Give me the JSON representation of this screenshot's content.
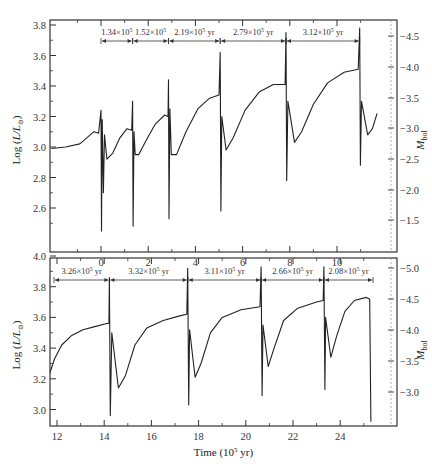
{
  "chart_data": [
    {
      "type": "line",
      "panel": "top",
      "title": "",
      "xlabel": "",
      "ylabel": "Log (L/L⊙)",
      "ylabel_right": "M_bol",
      "xlim": [
        -2.1,
        11.7
      ],
      "ylim": [
        2.45,
        3.85
      ],
      "ylim_right_labels": [
        "-4.5",
        "-4.0",
        "-3.5",
        "-3.0",
        "-2.5",
        "-2.0",
        "-1.5"
      ],
      "x_ticks": [
        "0",
        "2",
        "4",
        "6",
        "8",
        "10"
      ],
      "y_ticks": [
        "3.8",
        "3.6",
        "3.4",
        "3.2",
        "3.0",
        "2.8",
        "2.6"
      ],
      "grid": false,
      "annotations": [
        {
          "text": "1.34×10⁵",
          "x_from": 0.0,
          "x_to": 1.34
        },
        {
          "text": "1.52×10⁵",
          "x_from": 1.34,
          "x_to": 2.86
        },
        {
          "text": "2.19×10⁵ yr",
          "x_from": 2.86,
          "x_to": 5.05
        },
        {
          "text": "2.79×10⁵ yr",
          "x_from": 5.05,
          "x_to": 7.84
        },
        {
          "text": "3.12×10⁵ yr",
          "x_from": 7.84,
          "x_to": 10.96
        }
      ],
      "pulses_x": [
        0.0,
        1.34,
        2.86,
        5.05,
        7.84,
        10.96
      ],
      "series": [
        {
          "name": "luminosity",
          "points": [
            [
              -2.1,
              2.99
            ],
            [
              -1.5,
              3.0
            ],
            [
              -0.9,
              3.02
            ],
            [
              -0.6,
              3.06
            ],
            [
              -0.3,
              3.1
            ],
            [
              -0.1,
              3.09
            ],
            [
              0.0,
              3.24
            ],
            [
              0.02,
              2.45
            ],
            [
              0.05,
              3.18
            ],
            [
              0.1,
              2.7
            ],
            [
              0.15,
              3.08
            ],
            [
              0.25,
              2.92
            ],
            [
              0.5,
              2.96
            ],
            [
              0.8,
              3.06
            ],
            [
              1.1,
              3.12
            ],
            [
              1.3,
              3.11
            ],
            [
              1.34,
              3.3
            ],
            [
              1.36,
              2.48
            ],
            [
              1.4,
              3.1
            ],
            [
              1.45,
              2.95
            ],
            [
              1.6,
              2.95
            ],
            [
              1.9,
              3.04
            ],
            [
              2.3,
              3.15
            ],
            [
              2.7,
              3.21
            ],
            [
              2.84,
              3.2
            ],
            [
              2.86,
              3.44
            ],
            [
              2.88,
              2.53
            ],
            [
              2.92,
              3.25
            ],
            [
              2.98,
              2.95
            ],
            [
              3.2,
              2.95
            ],
            [
              3.6,
              3.1
            ],
            [
              4.1,
              3.25
            ],
            [
              4.6,
              3.32
            ],
            [
              5.0,
              3.34
            ],
            [
              5.05,
              3.62
            ],
            [
              5.08,
              2.58
            ],
            [
              5.12,
              3.2
            ],
            [
              5.3,
              2.98
            ],
            [
              5.6,
              3.06
            ],
            [
              6.1,
              3.24
            ],
            [
              6.7,
              3.36
            ],
            [
              7.3,
              3.41
            ],
            [
              7.8,
              3.41
            ],
            [
              7.84,
              3.75
            ],
            [
              7.87,
              2.78
            ],
            [
              7.92,
              3.3
            ],
            [
              8.2,
              3.03
            ],
            [
              8.5,
              3.1
            ],
            [
              9.0,
              3.28
            ],
            [
              9.6,
              3.42
            ],
            [
              10.3,
              3.49
            ],
            [
              10.9,
              3.51
            ],
            [
              10.96,
              3.78
            ],
            [
              10.99,
              2.88
            ],
            [
              11.04,
              3.3
            ],
            [
              11.3,
              3.08
            ],
            [
              11.5,
              3.12
            ],
            [
              11.7,
              3.22
            ]
          ]
        }
      ]
    },
    {
      "type": "line",
      "panel": "bottom",
      "title": "",
      "xlabel": "Time (10⁵ yr)",
      "ylabel": "Log (L/L⊙)",
      "ylabel_right": "M_bol",
      "xlim": [
        11.7,
        25.4
      ],
      "ylim": [
        2.9,
        4.02
      ],
      "ylim_right_labels": [
        "-5.0",
        "-4.5",
        "-4.0",
        "-3.5",
        "-3.0"
      ],
      "x_ticks": [
        "12",
        "14",
        "16",
        "18",
        "20",
        "22",
        "24"
      ],
      "y_ticks": [
        "4.0",
        "3.8",
        "3.6",
        "3.4",
        "3.2",
        "3.0"
      ],
      "grid": false,
      "annotations": [
        {
          "text": "3.26×10⁵ yr",
          "x_from": 11.7,
          "x_to": 14.22
        },
        {
          "text": "3.32×10⁵ yr",
          "x_from": 14.22,
          "x_to": 17.54
        },
        {
          "text": "3.11×10⁵ yr",
          "x_from": 17.54,
          "x_to": 20.65
        },
        {
          "text": "2.66×10⁵ yr",
          "x_from": 20.65,
          "x_to": 23.31
        },
        {
          "text": "2.08×10⁵ yr",
          "x_from": 23.31,
          "x_to": 25.39
        }
      ],
      "pulses_x": [
        14.22,
        17.54,
        20.65,
        23.31,
        25.3
      ],
      "series": [
        {
          "name": "luminosity",
          "points": [
            [
              11.7,
              3.24
            ],
            [
              11.9,
              3.33
            ],
            [
              12.2,
              3.42
            ],
            [
              12.6,
              3.48
            ],
            [
              13.1,
              3.52
            ],
            [
              13.6,
              3.54
            ],
            [
              14.1,
              3.56
            ],
            [
              14.2,
              3.56
            ],
            [
              14.22,
              3.85
            ],
            [
              14.26,
              2.96
            ],
            [
              14.32,
              3.5
            ],
            [
              14.6,
              3.14
            ],
            [
              14.9,
              3.22
            ],
            [
              15.3,
              3.42
            ],
            [
              15.8,
              3.53
            ],
            [
              16.5,
              3.58
            ],
            [
              17.2,
              3.61
            ],
            [
              17.5,
              3.62
            ],
            [
              17.54,
              3.92
            ],
            [
              17.58,
              3.03
            ],
            [
              17.62,
              3.52
            ],
            [
              17.85,
              3.21
            ],
            [
              18.1,
              3.3
            ],
            [
              18.5,
              3.5
            ],
            [
              19.0,
              3.6
            ],
            [
              19.8,
              3.65
            ],
            [
              20.6,
              3.67
            ],
            [
              20.65,
              3.93
            ],
            [
              20.69,
              3.09
            ],
            [
              20.73,
              3.55
            ],
            [
              20.95,
              3.28
            ],
            [
              21.2,
              3.4
            ],
            [
              21.6,
              3.58
            ],
            [
              22.2,
              3.66
            ],
            [
              23.0,
              3.7
            ],
            [
              23.28,
              3.71
            ],
            [
              23.31,
              3.93
            ],
            [
              23.35,
              3.13
            ],
            [
              23.38,
              3.6
            ],
            [
              23.6,
              3.34
            ],
            [
              23.85,
              3.48
            ],
            [
              24.2,
              3.64
            ],
            [
              24.6,
              3.71
            ],
            [
              25.1,
              3.73
            ],
            [
              25.25,
              3.72
            ],
            [
              25.3,
              2.92
            ]
          ]
        }
      ]
    }
  ]
}
